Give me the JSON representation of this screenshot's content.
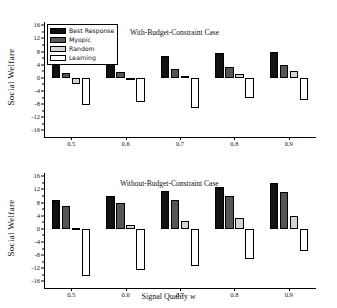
{
  "figure": {
    "xaxis_title": "Signal Quality",
    "xaxis_title_symbol": "w",
    "yaxis_title": "Social Welfare"
  },
  "legend": {
    "entries": [
      {
        "label": "Best Response",
        "color": "#111111"
      },
      {
        "label": "Myopic",
        "color": "#555555"
      },
      {
        "label": "Random",
        "color": "#d4d4d4"
      },
      {
        "label": "Learning",
        "color": "#ffffff"
      }
    ]
  },
  "chart_data": [
    {
      "type": "bar",
      "title": "With-Budget-Constraint Case",
      "xlabel": "Signal Quality w",
      "ylabel": "Social Welfare",
      "categories": [
        "0.5",
        "0.6",
        "0.7",
        "0.8",
        "0.9"
      ],
      "ylim": [
        -18,
        17
      ],
      "yticks": [
        16,
        12,
        8,
        4,
        0,
        -4,
        -8,
        -12,
        -16
      ],
      "grid": false,
      "legend_position": "top-left",
      "series": [
        {
          "name": "Best Response",
          "values": [
            5.1,
            5.6,
            6.6,
            7.5,
            8.0
          ]
        },
        {
          "name": "Myopic",
          "values": [
            1.5,
            1.8,
            2.6,
            3.2,
            3.9
          ]
        },
        {
          "name": "Random",
          "values": [
            -2.0,
            -0.8,
            0.5,
            1.2,
            2.0
          ]
        },
        {
          "name": "Learning",
          "values": [
            -8.2,
            -7.5,
            -9.3,
            -6.1,
            -6.8
          ]
        }
      ]
    },
    {
      "type": "bar",
      "title": "Without-Budget-Constraint Case",
      "xlabel": "Signal Quality w",
      "ylabel": "Social Welfare",
      "categories": [
        "0.5",
        "0.6",
        "0.7",
        "0.8",
        "0.9"
      ],
      "ylim": [
        -18,
        17
      ],
      "yticks": [
        16,
        12,
        8,
        4,
        0,
        -4,
        -8,
        -12,
        -16
      ],
      "grid": false,
      "legend_position": "none",
      "series": [
        {
          "name": "Best Response",
          "values": [
            8.7,
            10.0,
            11.5,
            12.7,
            14.0
          ]
        },
        {
          "name": "Myopic",
          "values": [
            7.0,
            7.9,
            8.8,
            10.1,
            11.3
          ]
        },
        {
          "name": "Random",
          "values": [
            0.4,
            1.3,
            2.5,
            3.2,
            3.8
          ]
        },
        {
          "name": "Learning",
          "values": [
            -14.2,
            -12.5,
            -11.3,
            -9.1,
            -6.8
          ]
        }
      ]
    }
  ]
}
